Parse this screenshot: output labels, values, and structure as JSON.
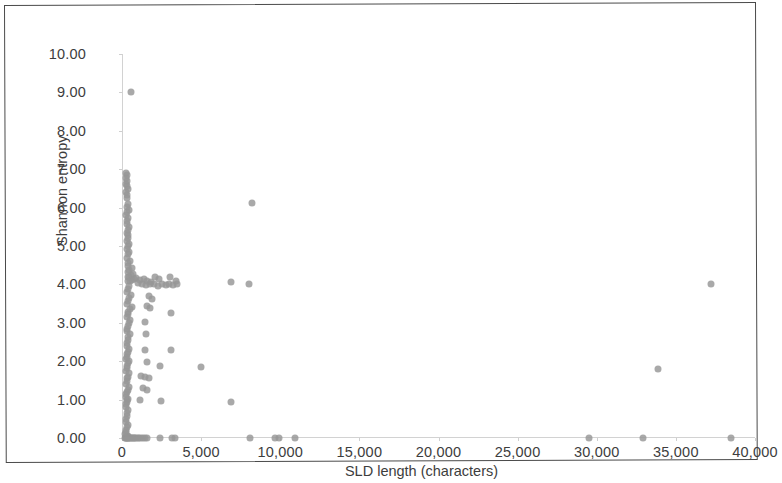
{
  "figure": {
    "background_color": "#ffffff",
    "border_color": "#4a4a4a",
    "marker_color": "#969696",
    "axis_color": "#d2d2d2",
    "text_color": "#3d3d3d"
  },
  "axes": {
    "x_title": "SLD length (characters)",
    "y_title": "Shannon entropy",
    "x_tick_labels": [
      "0",
      "5,000",
      "10,000",
      "15,000",
      "20,000",
      "25,000",
      "30,000",
      "35,000",
      "40,000"
    ],
    "y_tick_labels": [
      "0.00",
      "1.00",
      "2.00",
      "3.00",
      "4.00",
      "5.00",
      "6.00",
      "7.00",
      "8.00",
      "9.00",
      "10.00"
    ]
  },
  "chart_data": {
    "type": "scatter",
    "title": "",
    "xlabel": "SLD length (characters)",
    "ylabel": "Shannon entropy",
    "xlim": [
      0,
      40000
    ],
    "ylim": [
      0,
      10
    ],
    "xticks": [
      0,
      5000,
      10000,
      15000,
      20000,
      25000,
      30000,
      35000,
      40000
    ],
    "yticks": [
      0,
      1,
      2,
      3,
      4,
      5,
      6,
      7,
      8,
      9,
      10
    ],
    "grid": false,
    "legend": false,
    "marker_color": "#969696",
    "marker_size": 7,
    "series": [
      {
        "name": "SLD samples",
        "points": [
          [
            600,
            9.0
          ],
          [
            260,
            6.9
          ],
          [
            300,
            6.85
          ],
          [
            240,
            6.78
          ],
          [
            330,
            6.7
          ],
          [
            270,
            6.62
          ],
          [
            300,
            6.55
          ],
          [
            350,
            6.48
          ],
          [
            260,
            6.4
          ],
          [
            320,
            6.32
          ],
          [
            290,
            6.25
          ],
          [
            8200,
            6.12
          ],
          [
            350,
            6.1
          ],
          [
            300,
            6.02
          ],
          [
            420,
            5.95
          ],
          [
            330,
            5.88
          ],
          [
            280,
            5.8
          ],
          [
            390,
            5.72
          ],
          [
            340,
            5.65
          ],
          [
            300,
            5.58
          ],
          [
            450,
            5.5
          ],
          [
            360,
            5.42
          ],
          [
            310,
            5.35
          ],
          [
            400,
            5.28
          ],
          [
            350,
            5.2
          ],
          [
            300,
            5.12
          ],
          [
            470,
            5.05
          ],
          [
            380,
            5.0
          ],
          [
            330,
            4.92
          ],
          [
            420,
            4.85
          ],
          [
            360,
            4.78
          ],
          [
            310,
            4.7
          ],
          [
            500,
            4.62
          ],
          [
            400,
            4.55
          ],
          [
            350,
            4.48
          ],
          [
            620,
            4.42
          ],
          [
            460,
            4.38
          ],
          [
            380,
            4.32
          ],
          [
            700,
            4.28
          ],
          [
            540,
            4.24
          ],
          [
            430,
            4.2
          ],
          [
            350,
            4.18
          ],
          [
            900,
            4.16
          ],
          [
            760,
            4.14
          ],
          [
            640,
            4.12
          ],
          [
            520,
            4.1
          ],
          [
            410,
            4.08
          ],
          [
            1150,
            4.12
          ],
          [
            1380,
            4.14
          ],
          [
            1600,
            4.1
          ],
          [
            1850,
            4.06
          ],
          [
            2100,
            4.18
          ],
          [
            2350,
            4.13
          ],
          [
            3050,
            4.18
          ],
          [
            3400,
            4.08
          ],
          [
            6900,
            4.05
          ],
          [
            8000,
            4.0
          ],
          [
            37200,
            4.02
          ],
          [
            1000,
            4.04
          ],
          [
            1250,
            4.0
          ],
          [
            1500,
            3.98
          ],
          [
            1750,
            4.02
          ],
          [
            2000,
            4.0
          ],
          [
            2250,
            3.96
          ],
          [
            2500,
            4.0
          ],
          [
            2750,
            3.98
          ],
          [
            3000,
            4.0
          ],
          [
            3250,
            3.98
          ],
          [
            3500,
            4.02
          ],
          [
            420,
            3.95
          ],
          [
            380,
            3.88
          ],
          [
            330,
            3.8
          ],
          [
            560,
            3.72
          ],
          [
            450,
            3.65
          ],
          [
            1700,
            3.7
          ],
          [
            1900,
            3.62
          ],
          [
            390,
            3.58
          ],
          [
            340,
            3.5
          ],
          [
            610,
            3.42
          ],
          [
            480,
            3.35
          ],
          [
            400,
            3.28
          ],
          [
            1550,
            3.45
          ],
          [
            1750,
            3.38
          ],
          [
            3100,
            3.25
          ],
          [
            360,
            3.22
          ],
          [
            320,
            3.15
          ],
          [
            530,
            3.08
          ],
          [
            430,
            3.0
          ],
          [
            380,
            2.92
          ],
          [
            1450,
            3.02
          ],
          [
            340,
            2.85
          ],
          [
            300,
            2.78
          ],
          [
            500,
            2.7
          ],
          [
            410,
            2.62
          ],
          [
            360,
            2.55
          ],
          [
            1500,
            2.72
          ],
          [
            320,
            2.48
          ],
          [
            290,
            2.4
          ],
          [
            470,
            2.32
          ],
          [
            390,
            2.25
          ],
          [
            340,
            2.18
          ],
          [
            1480,
            2.3
          ],
          [
            3100,
            2.28
          ],
          [
            310,
            2.12
          ],
          [
            280,
            2.05
          ],
          [
            450,
            2.0
          ],
          [
            370,
            1.95
          ],
          [
            330,
            1.88
          ],
          [
            1600,
            1.98
          ],
          [
            2400,
            1.88
          ],
          [
            5000,
            1.85
          ],
          [
            33900,
            1.8
          ],
          [
            300,
            1.82
          ],
          [
            270,
            1.75
          ],
          [
            430,
            1.68
          ],
          [
            360,
            1.6
          ],
          [
            320,
            1.55
          ],
          [
            1200,
            1.62
          ],
          [
            1450,
            1.58
          ],
          [
            1700,
            1.55
          ],
          [
            290,
            1.48
          ],
          [
            260,
            1.4
          ],
          [
            420,
            1.33
          ],
          [
            350,
            1.26
          ],
          [
            310,
            1.2
          ],
          [
            1300,
            1.3
          ],
          [
            1550,
            1.25
          ],
          [
            280,
            1.15
          ],
          [
            250,
            1.08
          ],
          [
            400,
            1.02
          ],
          [
            340,
            0.98
          ],
          [
            300,
            0.95
          ],
          [
            1150,
            1.0
          ],
          [
            2450,
            0.97
          ],
          [
            6900,
            0.95
          ],
          [
            270,
            0.88
          ],
          [
            240,
            0.8
          ],
          [
            390,
            0.72
          ],
          [
            330,
            0.65
          ],
          [
            290,
            0.58
          ],
          [
            260,
            0.5
          ],
          [
            230,
            0.42
          ],
          [
            370,
            0.35
          ],
          [
            310,
            0.28
          ],
          [
            280,
            0.22
          ],
          [
            250,
            0.16
          ],
          [
            220,
            0.1
          ],
          [
            350,
            0.06
          ],
          [
            300,
            0.04
          ],
          [
            270,
            0.02
          ],
          [
            200,
            0.0
          ],
          [
            240,
            0.0
          ],
          [
            280,
            0.0
          ],
          [
            320,
            0.0
          ],
          [
            360,
            0.0
          ],
          [
            400,
            0.0
          ],
          [
            450,
            0.0
          ],
          [
            500,
            0.0
          ],
          [
            560,
            0.0
          ],
          [
            620,
            0.0
          ],
          [
            690,
            0.0
          ],
          [
            760,
            0.0
          ],
          [
            830,
            0.0
          ],
          [
            910,
            0.0
          ],
          [
            1000,
            0.0
          ],
          [
            1100,
            0.0
          ],
          [
            1200,
            0.0
          ],
          [
            1320,
            0.0
          ],
          [
            1450,
            0.0
          ],
          [
            1600,
            0.0
          ],
          [
            2400,
            0.0
          ],
          [
            3150,
            0.0
          ],
          [
            3350,
            0.0
          ],
          [
            8100,
            0.0
          ],
          [
            9650,
            0.0
          ],
          [
            9900,
            0.0
          ],
          [
            10950,
            0.0
          ],
          [
            29500,
            0.0
          ],
          [
            32900,
            0.0
          ],
          [
            38500,
            0.0
          ]
        ]
      }
    ]
  }
}
